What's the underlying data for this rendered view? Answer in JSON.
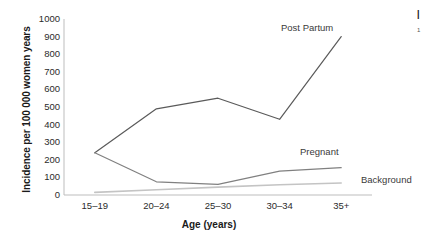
{
  "chart_data": {
    "type": "line",
    "title": "",
    "xlabel": "Age (years)",
    "ylabel": "Incidence per 100 000 women years",
    "categories": [
      "15–19",
      "20–24",
      "25–30",
      "30–34",
      "35+"
    ],
    "ylim": [
      0,
      1000
    ],
    "ytick_values": [
      0,
      100,
      200,
      300,
      400,
      500,
      600,
      700,
      800,
      900,
      1000
    ],
    "ytick_labels": [
      "0",
      "100",
      "200",
      "300",
      "400",
      "500",
      "600",
      "700",
      "800",
      "900",
      "1000"
    ],
    "grid": false,
    "legend_position": "inline-end-of-line-annotations",
    "series": [
      {
        "name": "Post Partum",
        "label": "Post Partum",
        "color": "#5a5a5a",
        "values": [
          240,
          490,
          550,
          430,
          900
        ]
      },
      {
        "name": "Pregnant",
        "label": "Pregnant",
        "color": "#808080",
        "values": [
          240,
          75,
          60,
          135,
          155
        ]
      },
      {
        "name": "Background",
        "label": "Background",
        "color": "#c4c4c4",
        "values": [
          15,
          30,
          45,
          58,
          68
        ]
      }
    ],
    "annotations": [
      {
        "text": "Post Partum",
        "series": "Post Partum"
      },
      {
        "text": "Pregnant",
        "series": "Pregnant"
      },
      {
        "text": "Background",
        "series": "Background"
      }
    ]
  },
  "edge_fragments": {
    "line1": "|",
    "line2": "1"
  }
}
